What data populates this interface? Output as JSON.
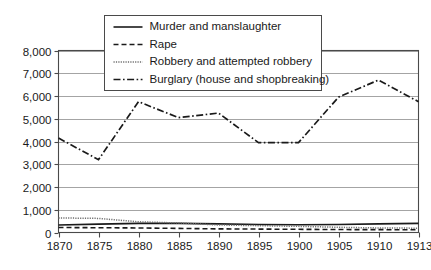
{
  "chart_data": {
    "type": "line",
    "title": "",
    "subtitle": "",
    "xlabel": "",
    "ylabel": "",
    "x": [
      1870,
      1875,
      1880,
      1885,
      1890,
      1895,
      1900,
      1905,
      1910,
      1913
    ],
    "categories": [
      "1870",
      "1875",
      "1880",
      "1885",
      "1890",
      "1895",
      "1900",
      "1905",
      "1910",
      "1913"
    ],
    "xtick_labels": [
      "1870",
      "1875",
      "1880",
      "1885",
      "1890",
      "1895",
      "1900",
      "1905",
      "1910",
      "1913"
    ],
    "ytick_labels": [
      "0",
      "1,000",
      "2,000",
      "3,000",
      "4,000",
      "5,000",
      "6,000",
      "7,000",
      "8,000"
    ],
    "ytick_values": [
      0,
      1000,
      2000,
      3000,
      4000,
      5000,
      6000,
      7000,
      8000
    ],
    "ylim": [
      0,
      8000
    ],
    "grid": "horizontal",
    "legend_position": "top-center",
    "series": [
      {
        "name": "Murder and manslaughter",
        "style": "solid",
        "color": "#1a1a1a",
        "values": [
          330,
          370,
          400,
          400,
          380,
          350,
          340,
          350,
          380,
          400
        ]
      },
      {
        "name": "Rape",
        "style": "dashed",
        "color": "#1a1a1a",
        "values": [
          220,
          210,
          200,
          180,
          160,
          150,
          140,
          130,
          125,
          120
        ]
      },
      {
        "name": "Robbery and attempted robbery",
        "style": "dotted",
        "color": "#6e6e6e",
        "values": [
          640,
          620,
          470,
          420,
          330,
          300,
          270,
          230,
          200,
          190
        ]
      },
      {
        "name": "Burglary (house and shopbreaking)",
        "style": "dashdot",
        "color": "#1a1a1a",
        "values": [
          4150,
          3200,
          5750,
          5050,
          5250,
          3950,
          3950,
          5950,
          6700,
          5750
        ]
      }
    ]
  },
  "legend": {
    "entries": [
      {
        "label": "Murder and manslaughter"
      },
      {
        "label": "Rape"
      },
      {
        "label": "Robbery and attempted robbery"
      },
      {
        "label": "Burglary (house and shopbreaking)"
      }
    ]
  }
}
